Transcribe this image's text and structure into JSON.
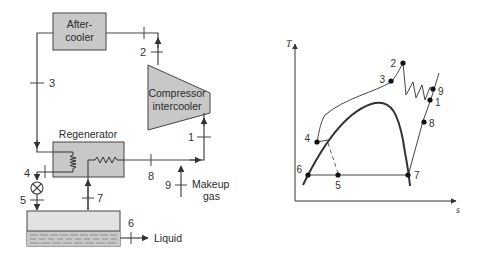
{
  "figure": {
    "schematic": {
      "components": {
        "aftercooler": {
          "line1": "After-",
          "line2": "cooler"
        },
        "compressor": {
          "line1": "Compressor",
          "line2": "intercooler"
        },
        "regenerator": {
          "label": "Regenerator"
        },
        "makeup": {
          "line1": "Makeup",
          "line2": "gas"
        },
        "liquid": {
          "label": "Liquid"
        }
      },
      "state_labels": {
        "s1": "1",
        "s2": "2",
        "s3": "3",
        "s4": "4",
        "s5": "5",
        "s6": "6",
        "s7": "7",
        "s8": "8",
        "s9": "9"
      },
      "colors": {
        "fill": "#c8c8c8",
        "tank_fill": "#dcdcdc",
        "line": "#333333"
      }
    },
    "ts_diagram": {
      "axis_labels": {
        "y": "T",
        "x": "s"
      },
      "points": {
        "p1": "1",
        "p2": "2",
        "p3": "3",
        "p4": "4",
        "p5": "5",
        "p6": "6",
        "p7": "7",
        "p8": "8",
        "p9": "9"
      }
    }
  }
}
